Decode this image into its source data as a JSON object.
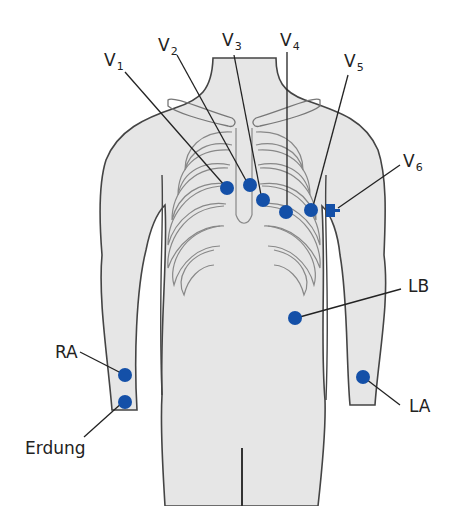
{
  "diagram": {
    "type": "ecg-electrode-placement",
    "colors": {
      "electrode": "#1450a8",
      "body_fill": "#e6e6e6",
      "outline": "#444444",
      "leader": "#222222"
    },
    "labels": {
      "v1": {
        "letter": "V",
        "sub": "1"
      },
      "v2": {
        "letter": "V",
        "sub": "2"
      },
      "v3": {
        "letter": "V",
        "sub": "3"
      },
      "v4": {
        "letter": "V",
        "sub": "4"
      },
      "v5": {
        "letter": "V",
        "sub": "5"
      },
      "v6": {
        "letter": "V",
        "sub": "6"
      },
      "lb": "LB",
      "ra": "RA",
      "la": "LA",
      "erdung": "Erdung"
    }
  }
}
